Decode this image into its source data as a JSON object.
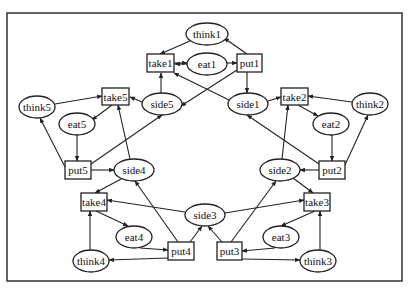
{
  "diagram": {
    "type": "petri-net",
    "frame": {
      "x": 7,
      "y": 13,
      "w": 395,
      "h": 268
    },
    "colors": {
      "stroke": "#222222",
      "background": "#ffffff",
      "text": "#111111"
    },
    "places": [
      {
        "id": "think1",
        "label": "think1",
        "cx": 207,
        "cy": 34,
        "rx": 21,
        "ry": 11
      },
      {
        "id": "eat1",
        "label": "eat1",
        "cx": 207,
        "cy": 64,
        "rx": 20,
        "ry": 11
      },
      {
        "id": "side5",
        "label": "side5",
        "cx": 162,
        "cy": 104,
        "rx": 20,
        "ry": 11
      },
      {
        "id": "side1",
        "label": "side1",
        "cx": 248,
        "cy": 104,
        "rx": 20,
        "ry": 11
      },
      {
        "id": "think5",
        "label": "think5",
        "cx": 37,
        "cy": 107,
        "rx": 18,
        "ry": 11
      },
      {
        "id": "eat5",
        "label": "eat5",
        "cx": 77,
        "cy": 124,
        "rx": 18,
        "ry": 11
      },
      {
        "id": "think2",
        "label": "think2",
        "cx": 370,
        "cy": 104,
        "rx": 18,
        "ry": 11
      },
      {
        "id": "eat2",
        "label": "eat2",
        "cx": 331,
        "cy": 124,
        "rx": 18,
        "ry": 11
      },
      {
        "id": "side4",
        "label": "side4",
        "cx": 134,
        "cy": 170,
        "rx": 20,
        "ry": 11
      },
      {
        "id": "side2",
        "label": "side2",
        "cx": 280,
        "cy": 170,
        "rx": 20,
        "ry": 11
      },
      {
        "id": "side3",
        "label": "side3",
        "cx": 205,
        "cy": 215,
        "rx": 20,
        "ry": 11
      },
      {
        "id": "eat4",
        "label": "eat4",
        "cx": 134,
        "cy": 237,
        "rx": 18,
        "ry": 11
      },
      {
        "id": "eat3",
        "label": "eat3",
        "cx": 281,
        "cy": 237,
        "rx": 18,
        "ry": 11
      },
      {
        "id": "think4",
        "label": "think4",
        "cx": 91,
        "cy": 261,
        "rx": 18,
        "ry": 11
      },
      {
        "id": "think3",
        "label": "think3",
        "cx": 318,
        "cy": 261,
        "rx": 18,
        "ry": 11
      }
    ],
    "transitions": [
      {
        "id": "take1",
        "label": "take1",
        "x": 147,
        "y": 54,
        "w": 27,
        "h": 18
      },
      {
        "id": "put1",
        "label": "put1",
        "x": 237,
        "y": 54,
        "w": 25,
        "h": 18
      },
      {
        "id": "take5",
        "label": "take5",
        "x": 102,
        "y": 88,
        "w": 27,
        "h": 17
      },
      {
        "id": "take2",
        "label": "take2",
        "x": 281,
        "y": 88,
        "w": 27,
        "h": 17
      },
      {
        "id": "put5",
        "label": "put5",
        "x": 65,
        "y": 161,
        "w": 26,
        "h": 18
      },
      {
        "id": "put2",
        "label": "put2",
        "x": 319,
        "y": 161,
        "w": 26,
        "h": 18
      },
      {
        "id": "take4",
        "label": "take4",
        "x": 81,
        "y": 193,
        "w": 26,
        "h": 18
      },
      {
        "id": "take3",
        "label": "take3",
        "x": 304,
        "y": 193,
        "w": 26,
        "h": 18
      },
      {
        "id": "put4",
        "label": "put4",
        "x": 168,
        "y": 242,
        "w": 26,
        "h": 18
      },
      {
        "id": "put3",
        "label": "put3",
        "x": 217,
        "y": 242,
        "w": 25,
        "h": 18
      }
    ],
    "arcs": [
      {
        "from": "think1",
        "to": "take1",
        "pts": [
          [
            190,
            41
          ],
          [
            160,
            54
          ]
        ]
      },
      {
        "from": "put1",
        "to": "think1",
        "pts": [
          [
            247,
            54
          ],
          [
            224,
            38
          ]
        ]
      },
      {
        "from": "take1",
        "to": "eat1",
        "pts": [
          [
            174,
            63
          ],
          [
            187,
            63
          ]
        ]
      },
      {
        "from": "eat1",
        "to": "take1",
        "pts": [
          [
            187,
            64
          ],
          [
            175,
            64
          ]
        ]
      },
      {
        "from": "eat1",
        "to": "put1",
        "pts": [
          [
            227,
            63
          ],
          [
            237,
            63
          ]
        ]
      },
      {
        "from": "side5",
        "to": "take1",
        "pts": [
          [
            161,
            93
          ],
          [
            161,
            73
          ]
        ]
      },
      {
        "from": "side1",
        "to": "take1",
        "pts": [
          [
            229,
            100
          ],
          [
            174,
            73
          ]
        ]
      },
      {
        "from": "put1",
        "to": "side1",
        "pts": [
          [
            247,
            72
          ],
          [
            247,
            93
          ]
        ]
      },
      {
        "from": "put1",
        "to": "side5",
        "pts": [
          [
            237,
            70
          ],
          [
            181,
            106
          ]
        ]
      },
      {
        "from": "think5",
        "to": "take5",
        "pts": [
          [
            55,
            104
          ],
          [
            102,
            96
          ]
        ]
      },
      {
        "from": "side5",
        "to": "take5",
        "pts": [
          [
            142,
            102
          ],
          [
            130,
            97
          ]
        ]
      },
      {
        "from": "take5",
        "to": "eat5",
        "pts": [
          [
            112,
            105
          ],
          [
            92,
            120
          ]
        ]
      },
      {
        "from": "eat5",
        "to": "put5",
        "pts": [
          [
            77,
            135
          ],
          [
            77,
            161
          ]
        ]
      },
      {
        "from": "put5",
        "to": "think5",
        "pts": [
          [
            65,
            167
          ],
          [
            40,
            118
          ]
        ]
      },
      {
        "from": "put5",
        "to": "side5",
        "pts": [
          [
            91,
            164
          ],
          [
            162,
            115
          ]
        ]
      },
      {
        "from": "put5",
        "to": "side4",
        "pts": [
          [
            91,
            170
          ],
          [
            114,
            170
          ]
        ]
      },
      {
        "from": "side4",
        "to": "take5",
        "pts": [
          [
            130,
            159
          ],
          [
            118,
            105
          ]
        ]
      },
      {
        "from": "side1",
        "to": "take2",
        "pts": [
          [
            268,
            101
          ],
          [
            281,
            97
          ]
        ]
      },
      {
        "from": "think2",
        "to": "take2",
        "pts": [
          [
            352,
            102
          ],
          [
            308,
            96
          ]
        ]
      },
      {
        "from": "take2",
        "to": "eat2",
        "pts": [
          [
            298,
            105
          ],
          [
            318,
            116
          ]
        ]
      },
      {
        "from": "eat2",
        "to": "put2",
        "pts": [
          [
            332,
            135
          ],
          [
            332,
            161
          ]
        ]
      },
      {
        "from": "put2",
        "to": "think2",
        "pts": [
          [
            345,
            165
          ],
          [
            368,
            115
          ]
        ]
      },
      {
        "from": "put2",
        "to": "side1",
        "pts": [
          [
            319,
            164
          ],
          [
            247,
            115
          ]
        ]
      },
      {
        "from": "put2",
        "to": "side2",
        "pts": [
          [
            319,
            170
          ],
          [
            300,
            170
          ]
        ]
      },
      {
        "from": "side2",
        "to": "take2",
        "pts": [
          [
            282,
            159
          ],
          [
            288,
            105
          ]
        ]
      },
      {
        "from": "side4",
        "to": "take4",
        "pts": [
          [
            121,
            179
          ],
          [
            95,
            193
          ]
        ]
      },
      {
        "from": "side3",
        "to": "take4",
        "pts": [
          [
            185,
            212
          ],
          [
            107,
            200
          ]
        ]
      },
      {
        "from": "take4",
        "to": "eat4",
        "pts": [
          [
            96,
            211
          ],
          [
            128,
            226
          ]
        ]
      },
      {
        "from": "eat4",
        "to": "put4",
        "pts": [
          [
            140,
            248
          ],
          [
            168,
            250
          ]
        ]
      },
      {
        "from": "put4",
        "to": "think4",
        "pts": [
          [
            168,
            258
          ],
          [
            109,
            260
          ]
        ]
      },
      {
        "from": "think4",
        "to": "take4",
        "pts": [
          [
            90,
            250
          ],
          [
            90,
            211
          ]
        ]
      },
      {
        "from": "put4",
        "to": "side4",
        "pts": [
          [
            178,
            242
          ],
          [
            135,
            181
          ]
        ]
      },
      {
        "from": "put4",
        "to": "side3",
        "pts": [
          [
            190,
            242
          ],
          [
            202,
            226
          ]
        ]
      },
      {
        "from": "side2",
        "to": "take3",
        "pts": [
          [
            293,
            178
          ],
          [
            313,
            193
          ]
        ]
      },
      {
        "from": "side3",
        "to": "take3",
        "pts": [
          [
            225,
            213
          ],
          [
            304,
            200
          ]
        ]
      },
      {
        "from": "take3",
        "to": "eat3",
        "pts": [
          [
            315,
            211
          ],
          [
            281,
            226
          ]
        ]
      },
      {
        "from": "eat3",
        "to": "put3",
        "pts": [
          [
            275,
            248
          ],
          [
            242,
            251
          ]
        ]
      },
      {
        "from": "put3",
        "to": "think3",
        "pts": [
          [
            242,
            259
          ],
          [
            300,
            260
          ]
        ]
      },
      {
        "from": "think3",
        "to": "take3",
        "pts": [
          [
            320,
            250
          ],
          [
            320,
            211
          ]
        ]
      },
      {
        "from": "put3",
        "to": "side2",
        "pts": [
          [
            231,
            242
          ],
          [
            276,
            181
          ]
        ]
      },
      {
        "from": "put3",
        "to": "side3",
        "pts": [
          [
            222,
            242
          ],
          [
            208,
            226
          ]
        ]
      }
    ]
  }
}
